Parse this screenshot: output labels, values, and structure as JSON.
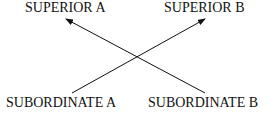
{
  "diagram": {
    "nodes": [
      {
        "id": "superior_a",
        "label": "SUPERIOR A"
      },
      {
        "id": "superior_b",
        "label": "SUPERIOR B"
      },
      {
        "id": "subordinate_a",
        "label": "SUBORDINATE A"
      },
      {
        "id": "subordinate_b",
        "label": "SUBORDINATE B"
      }
    ],
    "edges": [
      {
        "from": "subordinate_a",
        "to": "superior_b",
        "type": "arrow"
      },
      {
        "from": "subordinate_b",
        "to": "superior_a",
        "type": "arrow"
      }
    ]
  },
  "colors": {
    "ink": "#111111",
    "background": "#ffffff"
  }
}
